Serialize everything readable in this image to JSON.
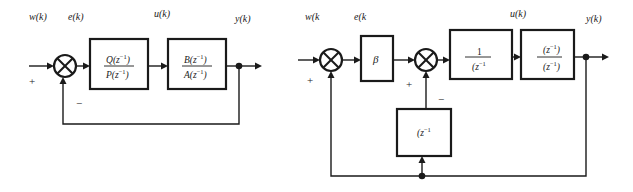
{
  "diagrams": [
    {
      "name": "simple-feedback-loop",
      "signals": {
        "input": "w(k)",
        "error": "e(k)",
        "control": "u(k)",
        "output": "y(k)"
      },
      "signs": {
        "input_plus": "+",
        "feedback_minus": "−"
      },
      "blocks": [
        {
          "id": "controller",
          "numerator": "Q(z⁻¹)",
          "denominator": "P(z⁻¹)",
          "num_letter": "Q",
          "den_letter": "P",
          "arg": "z",
          "exp": "−1"
        },
        {
          "id": "plant",
          "numerator": "B(z⁻¹)",
          "denominator": "A(z⁻¹)",
          "num_letter": "B",
          "den_letter": "A",
          "arg": "z",
          "exp": "−1"
        }
      ]
    },
    {
      "name": "two-loop-structure",
      "signals": {
        "input": "w(k",
        "error": "e(k",
        "control": "u(k)",
        "output": "y(k)"
      },
      "signs": {
        "outer_plus": "+",
        "inner_plus": "+",
        "inner_minus": "−"
      },
      "blocks": [
        {
          "id": "gain",
          "label": "β"
        },
        {
          "id": "prefilter",
          "numerator": "1",
          "denominator": "(z⁻¹",
          "den_text": "(z",
          "exp": "−1"
        },
        {
          "id": "plant",
          "numerator": "(z⁻¹)",
          "denominator": "(z⁻¹)",
          "num_text": "(z",
          "den_text": "(z",
          "exp": "−1",
          "close": ")"
        },
        {
          "id": "feedback",
          "label": "(z⁻¹",
          "text": "(z",
          "exp": "−1"
        }
      ]
    }
  ]
}
